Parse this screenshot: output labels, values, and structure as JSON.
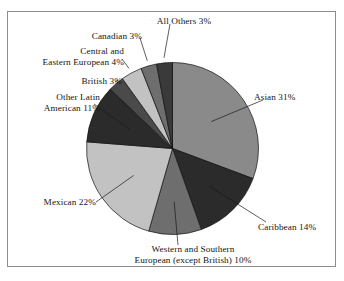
{
  "figure": {
    "frame_border_color": "#8c8c8c",
    "background": "#ffffff",
    "text_color": "#151515",
    "leader_line_color": "#1a1a1a"
  },
  "chart_data": {
    "type": "pie",
    "title": "",
    "subtitle": "",
    "xlabel": "",
    "ylabel": "",
    "legend_position": "callout-labels",
    "grid": false,
    "units": "percent",
    "start_angle_deg": 0,
    "direction": "clockwise",
    "categories": [
      "Asian",
      "Caribbean",
      "Western and Southern European (except British)",
      "Mexican",
      "Other Latin American",
      "British",
      "Central and Eastern European",
      "Canadian",
      "All Others"
    ],
    "values": [
      31,
      14,
      10,
      22,
      11,
      3,
      4,
      3,
      3
    ],
    "slice_colors": [
      "#8a8a8a",
      "#2b2b2b",
      "#6e6e6e",
      "#c2c2c2",
      "#2b2b2b",
      "#4a4a4a",
      "#c2c2c2",
      "#6e6e6e",
      "#3a3a3a"
    ],
    "labels": [
      "Asian 31%",
      "Caribbean 14%",
      "Western and Southern European (except British) 10%",
      "Mexican 22%",
      "Other Latin American 11%",
      "British 3%",
      "Central and Eastern European 4%",
      "Canadian 3%",
      "All Others 3%"
    ]
  },
  "callouts": {
    "asian": {
      "line1": "Asian 31%"
    },
    "caribbean": {
      "line1": "Caribbean 14%"
    },
    "western_southern_european": {
      "line1": "Western and Southern",
      "line2": "European (except British) 10%"
    },
    "mexican": {
      "line1": "Mexican 22%"
    },
    "other_latin_american": {
      "line1": "Other Latin",
      "line2": "American 11%"
    },
    "british": {
      "line1": "British 3%"
    },
    "central_eastern_european": {
      "line1": "Central and",
      "line2": "Eastern European 4%"
    },
    "canadian": {
      "line1": "Canadian 3%"
    },
    "all_others": {
      "line1": "All Others 3%"
    }
  }
}
